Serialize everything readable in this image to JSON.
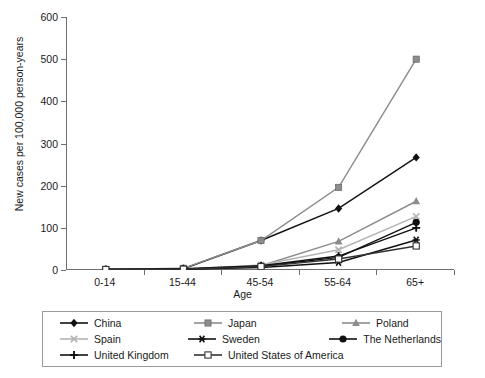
{
  "chart_data": {
    "type": "line",
    "title": "",
    "xlabel": "Age",
    "ylabel": "New cases per 100,000 person-years",
    "categories": [
      "0-14",
      "15-44",
      "45-54",
      "55-64",
      "65+"
    ],
    "ylim": [
      0,
      600
    ],
    "yticks": [
      0,
      100,
      200,
      300,
      400,
      500,
      600
    ],
    "grid": false,
    "legend_position": "below-plot",
    "series": [
      {
        "name": "China",
        "marker": "diamond-filled",
        "color": "#111111",
        "values": [
          1,
          3,
          70,
          146,
          267
        ]
      },
      {
        "name": "Japan",
        "marker": "square-filled",
        "color": "#8c8c8c",
        "values": [
          1,
          4,
          70,
          196,
          500
        ]
      },
      {
        "name": "Poland",
        "marker": "triangle-filled",
        "color": "#8c8c8c",
        "values": [
          1,
          2,
          10,
          68,
          163
        ]
      },
      {
        "name": "Spain",
        "marker": "x-cross",
        "color": "#b4b4b4",
        "values": [
          1,
          2,
          12,
          48,
          127
        ]
      },
      {
        "name": "Sweden",
        "marker": "asterisk",
        "color": "#111111",
        "values": [
          1,
          2,
          6,
          18,
          71
        ]
      },
      {
        "name": "The Netherlands",
        "marker": "circle-filled",
        "color": "#111111",
        "values": [
          1,
          2,
          9,
          30,
          113
        ]
      },
      {
        "name": "United Kingdom",
        "marker": "plus",
        "color": "#111111",
        "values": [
          1,
          3,
          10,
          33,
          100
        ]
      },
      {
        "name": "United States of America",
        "marker": "square-open",
        "color": "#333333",
        "values": [
          1,
          2,
          8,
          26,
          57
        ]
      }
    ]
  },
  "legend": {
    "rows": [
      [
        {
          "label": "China",
          "key": 0
        },
        {
          "label": "Japan",
          "key": 1
        },
        {
          "label": "Poland",
          "key": 2
        }
      ],
      [
        {
          "label": "Spain",
          "key": 3
        },
        {
          "label": "Sweden",
          "key": 4
        },
        {
          "label": "The Netherlands",
          "key": 5
        }
      ],
      [
        {
          "label": "United Kingdom",
          "key": 6
        },
        {
          "label": "United States of America",
          "key": 7
        }
      ]
    ]
  }
}
